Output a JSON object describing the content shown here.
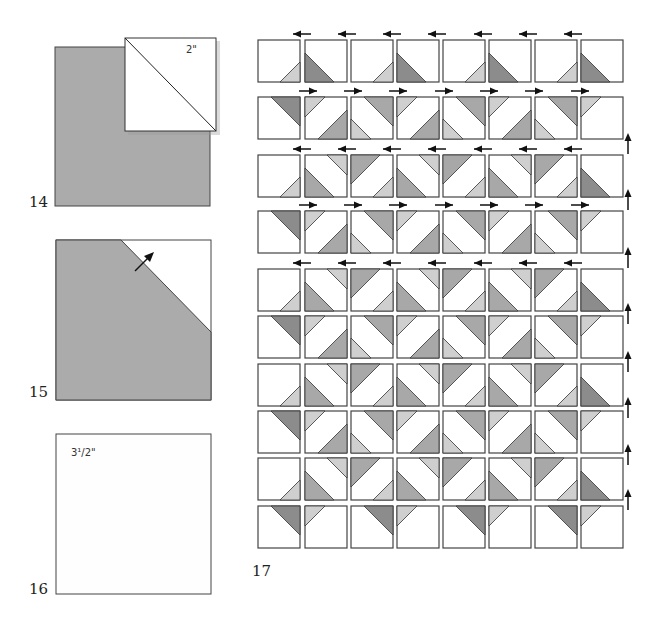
{
  "colors": {
    "dark": "#8c8c8c",
    "mid": "#a8a8a8",
    "light": "#cfcfcf",
    "background_square": "#ababab",
    "outline": "#444444",
    "white": "#ffffff"
  },
  "steps": [
    {
      "number": "14",
      "annotation": "2\"",
      "description": "2 inch white square placed on top-right corner of gray square, diagonal drawn"
    },
    {
      "number": "15",
      "annotation": "",
      "description": "Corner stitched and pressed open, arrow shows press direction"
    },
    {
      "number": "16",
      "annotation": "3½\"",
      "annotation_display": "3¹/2\"",
      "description": "3 1/2 inch white square"
    },
    {
      "number": "17",
      "description": "Quilt center layout: 10 rows x 8 blocks with pressing arrows"
    }
  ],
  "layout": {
    "rows": 10,
    "columns": 8,
    "row_arrow_directions": [
      "left",
      "right",
      "left",
      "right",
      "left",
      "none",
      "none",
      "none",
      "none",
      "none"
    ],
    "block_legend": {
      "A": "white with light small triangle bottom-right",
      "B": "white with dark large triangle bottom-left",
      "C": "white with dark large triangle top-right",
      "D": "light small top-left + mid large bottom-right",
      "E": "mid large top-right + light small bottom-left",
      "F": "light small top-left only",
      "G": "mid large bottom-left + light small top-right",
      "H": "mid large top-left + light small bottom-right"
    },
    "grid": [
      [
        "A",
        "B",
        "A",
        "B",
        "A",
        "B",
        "A",
        "B"
      ],
      [
        "C",
        "D",
        "E",
        "D",
        "E",
        "D",
        "E",
        "F"
      ],
      [
        "A",
        "G",
        "H",
        "G",
        "H",
        "G",
        "H",
        "B"
      ],
      [
        "C",
        "D",
        "E",
        "D",
        "E",
        "D",
        "E",
        "F"
      ],
      [
        "A",
        "G",
        "H",
        "G",
        "H",
        "G",
        "H",
        "B"
      ],
      [
        "C",
        "D",
        "E",
        "D",
        "E",
        "D",
        "E",
        "F"
      ],
      [
        "A",
        "G",
        "H",
        "G",
        "H",
        "G",
        "H",
        "B"
      ],
      [
        "C",
        "D",
        "E",
        "D",
        "E",
        "D",
        "E",
        "F"
      ],
      [
        "A",
        "G",
        "H",
        "G",
        "H",
        "G",
        "H",
        "B"
      ],
      [
        "C",
        "F",
        "C",
        "F",
        "C",
        "F",
        "C",
        "F"
      ]
    ]
  }
}
